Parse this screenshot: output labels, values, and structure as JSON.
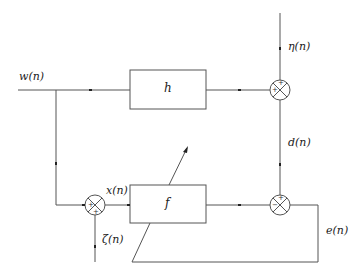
{
  "diagram": {
    "type": "block-diagram",
    "signals": {
      "input": "w(n)",
      "noise_top": "η(n)",
      "desired": "d(n)",
      "filter_input": "x(n)",
      "noise_left": "ζ(n)",
      "error": "e(n)"
    },
    "blocks": {
      "plant": "h",
      "adaptive_filter": "f"
    },
    "junctions": [
      {
        "id": "top",
        "signs": [
          "+",
          "+"
        ]
      },
      {
        "id": "left",
        "signs": [
          "+",
          "+"
        ]
      },
      {
        "id": "bottom",
        "signs": [
          "+",
          "−"
        ]
      }
    ],
    "colors": {
      "line": "#555555",
      "text": "#222222",
      "background": "#ffffff"
    }
  }
}
